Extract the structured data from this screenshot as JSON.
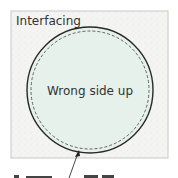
{
  "diagram": {
    "frame_label": "Interfacing",
    "circle_label": "Wrong side up",
    "caption_partial": "",
    "colors": {
      "frame_fill": "#f4f4f2",
      "frame_stroke": "#c8c8c8",
      "circle_fill": "#e6f1ec",
      "circle_stroke": "#2a2a2a",
      "stitch_stroke": "#555555",
      "text": "#333333"
    }
  }
}
